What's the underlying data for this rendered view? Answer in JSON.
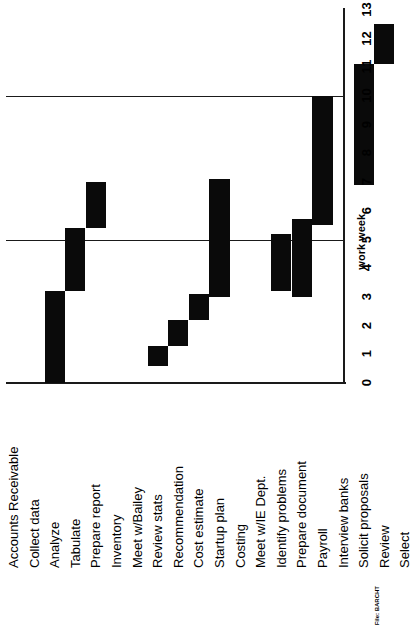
{
  "chart_data": {
    "type": "bar",
    "title": "",
    "orientation": "rotated-90-ccw-gantt",
    "xlabel": "",
    "ylabel": "work week",
    "ylim": [
      0,
      13
    ],
    "yticks": [
      0,
      1,
      2,
      3,
      4,
      5,
      6,
      7,
      8,
      9,
      10,
      11,
      12,
      13
    ],
    "gridlines": [
      5,
      10
    ],
    "grid": true,
    "legend": null,
    "bar_color": "#0a0a0a",
    "categories": [
      "Accounts Receivable",
      "Collect data",
      "Analyze",
      "Tabulate",
      "Prepare report",
      "Inventory",
      "Meet w/Bailey",
      "Review stats",
      "Recommendation",
      "Cost estimate",
      "Startup plan",
      "Costing",
      "Meet w/IE Dept.",
      "Identify problems",
      "Prepare document",
      "Payroll",
      "Interview banks",
      "Solicit proposals",
      "Review",
      "Select"
    ],
    "bars": [
      {
        "category": "Accounts Receivable",
        "is_group": true,
        "start": null,
        "end": null
      },
      {
        "category": "Collect data",
        "is_group": false,
        "start": 0.0,
        "end": 3.2
      },
      {
        "category": "Analyze",
        "is_group": false,
        "start": 3.2,
        "end": 5.4
      },
      {
        "category": "Tabulate",
        "is_group": false,
        "start": 5.4,
        "end": 7.0
      },
      {
        "category": "Prepare report",
        "is_group": false,
        "start": null,
        "end": null
      },
      {
        "category": "Inventory",
        "is_group": true,
        "start": null,
        "end": null
      },
      {
        "category": "Meet w/Bailey",
        "is_group": false,
        "start": 0.6,
        "end": 1.3
      },
      {
        "category": "Review stats",
        "is_group": false,
        "start": 1.3,
        "end": 2.2
      },
      {
        "category": "Recommendation",
        "is_group": false,
        "start": 2.2,
        "end": 3.1
      },
      {
        "category": "Cost estimate",
        "is_group": false,
        "start": 3.0,
        "end": 7.1
      },
      {
        "category": "Startup plan",
        "is_group": false,
        "start": null,
        "end": null
      },
      {
        "category": "Costing",
        "is_group": true,
        "start": null,
        "end": null
      },
      {
        "category": "Meet w/IE Dept.",
        "is_group": false,
        "start": 3.2,
        "end": 5.2
      },
      {
        "category": "Identify problems",
        "is_group": false,
        "start": 3.0,
        "end": 5.7
      },
      {
        "category": "Prepare document",
        "is_group": false,
        "start": 5.5,
        "end": 10.0
      },
      {
        "category": "Payroll",
        "is_group": true,
        "start": null,
        "end": null
      },
      {
        "category": "Interview banks",
        "is_group": false,
        "start": 6.9,
        "end": 11.1
      },
      {
        "category": "Solicit proposals",
        "is_group": false,
        "start": 11.1,
        "end": 12.5
      },
      {
        "category": "Review",
        "is_group": false,
        "start": null,
        "end": null
      },
      {
        "category": "Select",
        "is_group": false,
        "start": null,
        "end": null
      }
    ]
  },
  "axis": {
    "value_axis_title": "work week",
    "tick_labels": [
      "0",
      "1",
      "2",
      "3",
      "4",
      "5",
      "6",
      "7",
      "8",
      "9",
      "10",
      "11",
      "12",
      "13"
    ]
  },
  "footer": {
    "file_note": "File: BARCHT"
  }
}
